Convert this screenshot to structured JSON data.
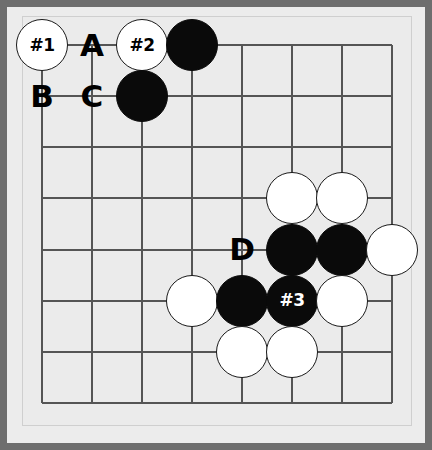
{
  "diagram": {
    "kind": "go-board-problem",
    "board": {
      "columns": 8,
      "rows": 8,
      "grid_color": "#555555",
      "board_color": "#ebebeb",
      "frame_color": "#6e6e6e",
      "left_px": 42,
      "top_px": 45,
      "col_spacing_px": 50,
      "row_spacing_px": 51.14,
      "stone_radius_px": 26
    },
    "colors": {
      "black_stone": "#0a0a0a",
      "white_stone": "#ffffff",
      "stone_outline": "#1a1a1a",
      "label_text": "#000000",
      "black_stone_label_text": "#ffffff"
    },
    "stones": [
      {
        "id": "w-0-0",
        "color": "white",
        "col": 0,
        "row": 0,
        "label": "#1"
      },
      {
        "id": "w-2-0",
        "color": "white",
        "col": 2,
        "row": 0,
        "label": "#2"
      },
      {
        "id": "b-3-0",
        "color": "black",
        "col": 3,
        "row": 0,
        "label": ""
      },
      {
        "id": "b-2-1",
        "color": "black",
        "col": 2,
        "row": 1,
        "label": ""
      },
      {
        "id": "w-5-3",
        "color": "white",
        "col": 5,
        "row": 3,
        "label": ""
      },
      {
        "id": "w-6-3",
        "color": "white",
        "col": 6,
        "row": 3,
        "label": ""
      },
      {
        "id": "b-5-4",
        "color": "black",
        "col": 5,
        "row": 4,
        "label": ""
      },
      {
        "id": "b-6-4",
        "color": "black",
        "col": 6,
        "row": 4,
        "label": ""
      },
      {
        "id": "w-7-4",
        "color": "white",
        "col": 7,
        "row": 4,
        "label": ""
      },
      {
        "id": "w-3-5",
        "color": "white",
        "col": 3,
        "row": 5,
        "label": ""
      },
      {
        "id": "b-4-5",
        "color": "black",
        "col": 4,
        "row": 5,
        "label": ""
      },
      {
        "id": "b-5-5",
        "color": "black",
        "col": 5,
        "row": 5,
        "label": "#3"
      },
      {
        "id": "w-6-5",
        "color": "white",
        "col": 6,
        "row": 5,
        "label": ""
      },
      {
        "id": "w-4-6",
        "color": "white",
        "col": 4,
        "row": 6,
        "label": ""
      },
      {
        "id": "w-5-6",
        "color": "white",
        "col": 5,
        "row": 6,
        "label": ""
      }
    ],
    "point_labels": [
      {
        "id": "label-a",
        "text": "A",
        "col": 1,
        "row": 0
      },
      {
        "id": "label-b",
        "text": "B",
        "col": 0,
        "row": 1
      },
      {
        "id": "label-c",
        "text": "C",
        "col": 1,
        "row": 1
      },
      {
        "id": "label-d",
        "text": "D",
        "col": 4,
        "row": 4
      }
    ],
    "move_markers": [
      {
        "text": "#1",
        "on": "white",
        "col": 0,
        "row": 0
      },
      {
        "text": "#2",
        "on": "white",
        "col": 2,
        "row": 0
      },
      {
        "text": "#3",
        "on": "black",
        "col": 5,
        "row": 5
      }
    ]
  }
}
